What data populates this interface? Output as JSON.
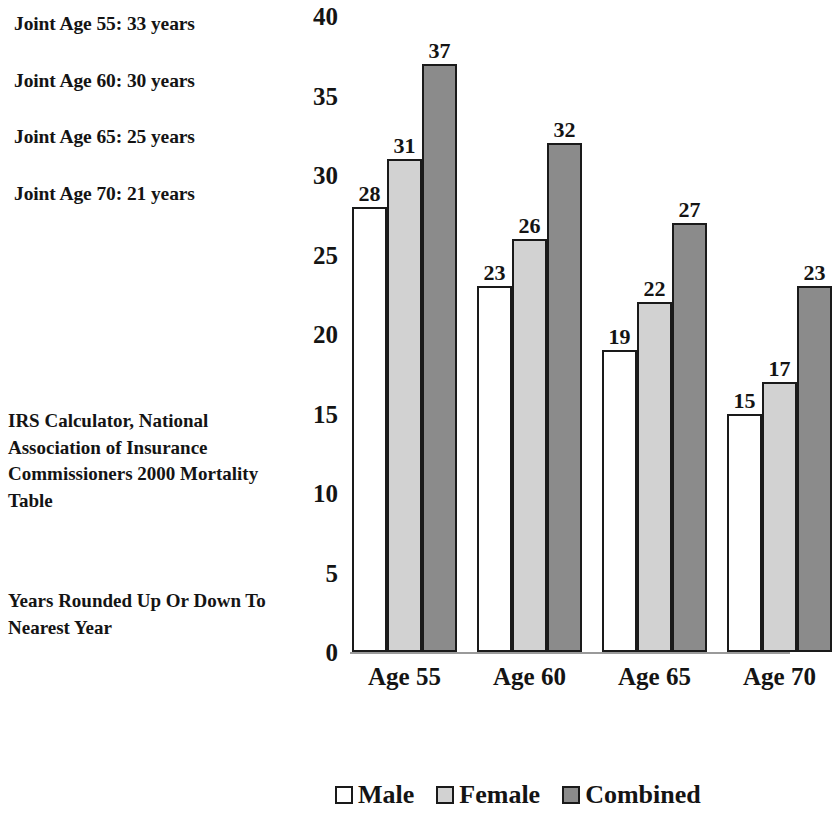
{
  "annotations": {
    "joint_lines": [
      "Joint Age 55: 33 years",
      "Joint Age 60: 30 years",
      "Joint Age 65: 25 years",
      "Joint Age 70: 21 years"
    ],
    "source_note": "IRS Calculator, National Association of Insurance Commissioners 2000 Mortality Table",
    "rounding_note": "Years Rounded Up Or Down To Nearest Year"
  },
  "chart_data": {
    "type": "bar",
    "title": "",
    "xlabel": "",
    "ylabel": "",
    "categories": [
      "Age 55",
      "Age 60",
      "Age 65",
      "Age 70"
    ],
    "series": [
      {
        "name": "Male",
        "color": "#ffffff",
        "values": [
          28,
          23,
          19,
          15
        ]
      },
      {
        "name": "Female",
        "color": "#d2d2d2",
        "values": [
          31,
          26,
          22,
          17
        ]
      },
      {
        "name": "Combined",
        "color": "#8b8b8b",
        "values": [
          37,
          32,
          27,
          23
        ]
      }
    ],
    "ylim": [
      0,
      40
    ],
    "ytick_step": 5,
    "yticks": [
      0,
      5,
      10,
      15,
      20,
      25,
      30,
      35,
      40
    ],
    "grid": false,
    "legend_position": "bottom",
    "value_labels": true
  }
}
